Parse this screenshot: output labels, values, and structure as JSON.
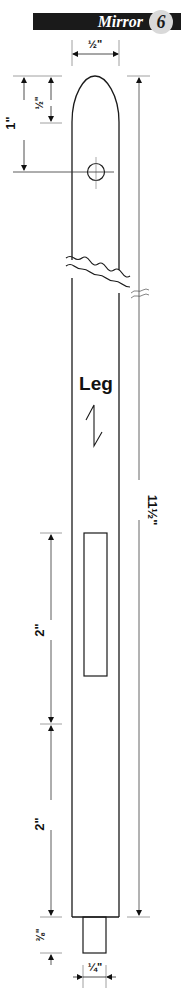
{
  "header": {
    "title": "Mirror",
    "step_number": "6",
    "bar_color": "#1a1a1a",
    "badge_color": "#d9d9d9"
  },
  "part": {
    "name": "Leg",
    "grain_symbol": "grain-direction-arrow",
    "features": [
      "rounded-top",
      "drill-hole",
      "mortise",
      "tenon",
      "break-lines"
    ]
  },
  "dimensions": {
    "top_width": "½\"",
    "hole_from_top": "1\"",
    "round_length": "½\"",
    "overall_length": "11½\"",
    "mortise_length": "2\"",
    "mortise_to_shoulder": "2\"",
    "tenon_length": "⅜\"",
    "tenon_width": "¼\""
  },
  "colors": {
    "line": "#1a1a1a",
    "dim_line": "#333333",
    "extension_line": "#888888"
  }
}
